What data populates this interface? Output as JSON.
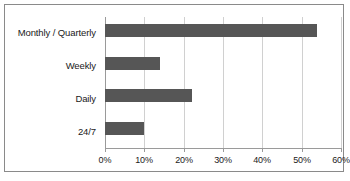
{
  "chart_data": {
    "type": "bar",
    "orientation": "horizontal",
    "title": "",
    "xlabel": "",
    "ylabel": "",
    "categories": [
      "Monthly / Quarterly",
      "Weekly",
      "Daily",
      "24/7"
    ],
    "values": [
      54,
      14,
      22,
      10
    ],
    "value_suffix": "%",
    "xlim": [
      0,
      60
    ],
    "xticks": [
      0,
      10,
      20,
      30,
      40,
      50,
      60
    ],
    "xtick_labels": [
      "0%",
      "10%",
      "20%",
      "30%",
      "40%",
      "50%",
      "60%"
    ],
    "grid": true,
    "grid_axis": "x",
    "legend": false,
    "legend_position": "none",
    "bar_color": "#565656",
    "gridline_color": "#d0d0d0",
    "axis_color": "#9a9a9a",
    "border_color": "#8a8a8a",
    "background_color": "#ffffff",
    "text_color": "#1a1a1a"
  }
}
